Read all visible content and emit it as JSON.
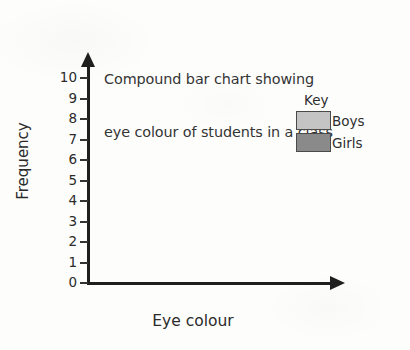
{
  "chart_data": {
    "type": "bar",
    "subtype": "stacked",
    "title": "Compound bar chart showing eye colour of students in a class",
    "title_lines": [
      "Compound bar chart showing",
      "eye colour of students in a class"
    ],
    "xlabel": "Eye colour",
    "ylabel": "Frequency",
    "categories": [
      "Brown",
      "Hazel",
      "Blue",
      "Green"
    ],
    "series": [
      {
        "name": "Boys",
        "values": [
          5,
          0,
          3,
          4
        ],
        "color": "#c4c4c4"
      },
      {
        "name": "Girls",
        "values": [
          2,
          3,
          7,
          1
        ],
        "color": "#8a8a8a"
      }
    ],
    "totals": [
      7,
      3,
      10,
      5
    ],
    "ylim": [
      0,
      10
    ],
    "ytick_values": [
      0,
      1,
      2,
      3,
      4,
      5,
      6,
      7,
      8,
      9,
      10
    ],
    "ytick_labels": [
      "0",
      "1",
      "2",
      "3",
      "4",
      "5",
      "6",
      "7",
      "8",
      "9",
      "10"
    ],
    "grid": false,
    "legend_position": "inside-top-right",
    "legend_title": "Key",
    "axis_arrows": true
  },
  "legend": {
    "title": "Key",
    "entries": [
      {
        "label": "Boys",
        "color": "#c4c4c4"
      },
      {
        "label": "Girls",
        "color": "#8a8a8a"
      }
    ]
  },
  "colors": {
    "boys": "#c4c4c4",
    "girls": "#8a8a8a",
    "bar_border": "#4a4a4a",
    "axis": "#1f1f1f",
    "text": "#2b2b2b",
    "background": "#fdfdfc"
  }
}
